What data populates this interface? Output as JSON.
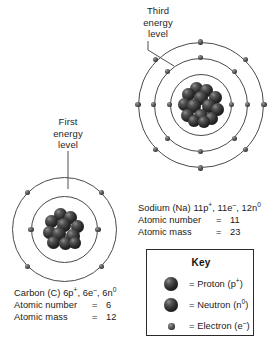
{
  "figure": {
    "type": "bohr-atomic-model-diagram",
    "background": "#ffffff",
    "ink_color": "#1a1a1a"
  },
  "callouts": [
    {
      "id": "third-energy-level",
      "lines": [
        "Third",
        "energy",
        "level"
      ],
      "points_to": "sodium-shell-3"
    },
    {
      "id": "first-energy-level",
      "lines": [
        "First",
        "energy",
        "level"
      ],
      "points_to": "carbon-shell-1"
    }
  ],
  "atoms": {
    "sodium": {
      "name": "Sodium",
      "symbol": "Na",
      "shells": [
        2,
        8,
        1
      ],
      "protons": 11,
      "electrons": 11,
      "neutrons": 12,
      "atomic_number": 11,
      "atomic_mass": 23,
      "composition_line": {
        "prefix": "Sodium (Na) ",
        "protons": "11p",
        "protons_sup": "+",
        "sep1": ", ",
        "electrons": "11e",
        "electrons_sup": "–",
        "sep2": ", ",
        "neutrons": "12n",
        "neutrons_sup": "0"
      },
      "rows": [
        {
          "label": "Atomic number",
          "eq": "=",
          "value": "11"
        },
        {
          "label": "Atomic mass",
          "eq": "=",
          "value": "23"
        }
      ]
    },
    "carbon": {
      "name": "Carbon",
      "symbol": "C",
      "shells": [
        2,
        4
      ],
      "protons": 6,
      "electrons": 6,
      "neutrons": 6,
      "atomic_number": 6,
      "atomic_mass": 12,
      "composition_line": {
        "prefix": "Carbon (C) ",
        "protons": "6p",
        "protons_sup": "+",
        "sep1": ", ",
        "electrons": "6e",
        "electrons_sup": "–",
        "sep2": ", ",
        "neutrons": "6n",
        "neutrons_sup": "0"
      },
      "rows": [
        {
          "label": "Atomic number",
          "eq": "=",
          "value": "6"
        },
        {
          "label": "Atomic mass",
          "eq": "=",
          "value": "12"
        }
      ]
    }
  },
  "key": {
    "title": "Key",
    "items": [
      {
        "icon": "proton-sphere-icon",
        "eq": "=",
        "name": "Proton",
        "open": "(",
        "sym": "p",
        "sup": "+",
        "close": ")"
      },
      {
        "icon": "neutron-sphere-icon",
        "eq": "=",
        "name": "Neutron",
        "open": "(",
        "sym": "n",
        "sup": "0",
        "close": ")"
      },
      {
        "icon": "electron-sphere-icon",
        "eq": "=",
        "name": "Electron",
        "open": "(",
        "sym": "e",
        "sup": "–",
        "close": ")"
      }
    ]
  }
}
